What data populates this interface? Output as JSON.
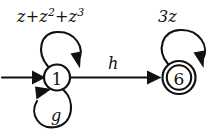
{
  "diagram": {
    "type": "state-transition-diagram",
    "title": "",
    "background_color": "#ffffff",
    "stroke_color": "#111111",
    "states": [
      {
        "id": "1",
        "label": "1",
        "accepting": false,
        "start": true,
        "center": [
          57,
          77
        ],
        "radius": 13
      },
      {
        "id": "6",
        "label": "6",
        "accepting": true,
        "start": false,
        "center": [
          179,
          77
        ],
        "radius_outer": 16,
        "radius_inner": 12
      }
    ],
    "transitions": [
      {
        "id": "loop-1-top",
        "from": "1",
        "to": "1",
        "kind": "self-loop",
        "position": "above",
        "label_text": "z+z2+z3",
        "label_parts": [
          {
            "text": "z",
            "sup": ""
          },
          {
            "text": "+z",
            "sup": "2"
          },
          {
            "text": "+z",
            "sup": "3"
          }
        ]
      },
      {
        "id": "loop-1-bottom",
        "from": "1",
        "to": "1",
        "kind": "self-loop",
        "position": "below",
        "label_text": "g",
        "label_parts": [
          {
            "text": "g",
            "sup": ""
          }
        ]
      },
      {
        "id": "edge-1-to-6",
        "from": "1",
        "to": "6",
        "kind": "straight",
        "position": "above",
        "label_text": "h",
        "label_parts": [
          {
            "text": "h",
            "sup": ""
          }
        ]
      },
      {
        "id": "loop-6-top",
        "from": "6",
        "to": "6",
        "kind": "self-loop",
        "position": "above",
        "label_text": "3z",
        "label_parts": [
          {
            "text": "3z",
            "sup": ""
          }
        ]
      }
    ],
    "start_arrow": {
      "id": "start-arrow",
      "target": "1",
      "from": [
        2,
        77
      ],
      "to": [
        44,
        77
      ]
    }
  }
}
